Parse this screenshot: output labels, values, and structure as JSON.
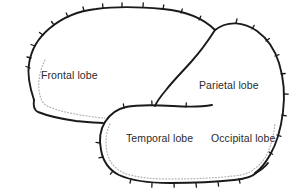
{
  "diagram": {
    "type": "anatomical-illustration",
    "background_color": "#ffffff",
    "outline_color": "#1a1a1a",
    "inner_dotted_color": "#b5b5b5",
    "label_color": "#2b2b2b",
    "width": 296,
    "height": 195
  },
  "labels": {
    "frontal": "Frontal lobe",
    "parietal": "Parietal lobe",
    "temporal": "Temporal lobe",
    "occipital": "Occipital lobe"
  },
  "regions": [
    {
      "name": "frontal-lobe",
      "label": "Frontal lobe",
      "label_x": 41,
      "label_y": 70
    },
    {
      "name": "parietal-lobe",
      "label": "Parietal lobe",
      "label_x": 199,
      "label_y": 80
    },
    {
      "name": "temporal-lobe",
      "label": "Temporal lobe",
      "label_x": 126,
      "label_y": 133
    },
    {
      "name": "occipital-lobe",
      "label": "Occipital lobe",
      "label_x": 211,
      "label_y": 133
    }
  ],
  "features": [
    {
      "name": "cerebrum-outline",
      "description": "solid notched outer contour of the cerebral hemisphere"
    },
    {
      "name": "central-sulcus",
      "description": "boundary line between frontal and parietal lobes"
    },
    {
      "name": "lateral-fissure",
      "description": "horizontal Sylvian fissure above the temporal lobe"
    },
    {
      "name": "temporal-outline",
      "description": "solid notched contour of the temporal lobe"
    },
    {
      "name": "inner-cortex-dots",
      "description": "dotted inner cortical boundary line"
    }
  ]
}
